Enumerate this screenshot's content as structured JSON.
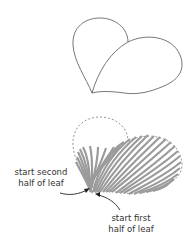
{
  "diagram": {
    "top_figure": {
      "description": "Leaf outline (two lobes)",
      "stroke_color": "#666666"
    },
    "bottom_figure": {
      "description": "Leaf partially filled with stitches; left lobe dashed outline",
      "stitch_color": "#9b9b9b",
      "dashed_outline_color": "#8a8a8a"
    },
    "labels": {
      "second_half": {
        "line1": "start second",
        "line2": "half of leaf"
      },
      "first_half": {
        "line1": "start first",
        "line2": "half of leaf"
      }
    },
    "arrow_color": "#222222"
  }
}
